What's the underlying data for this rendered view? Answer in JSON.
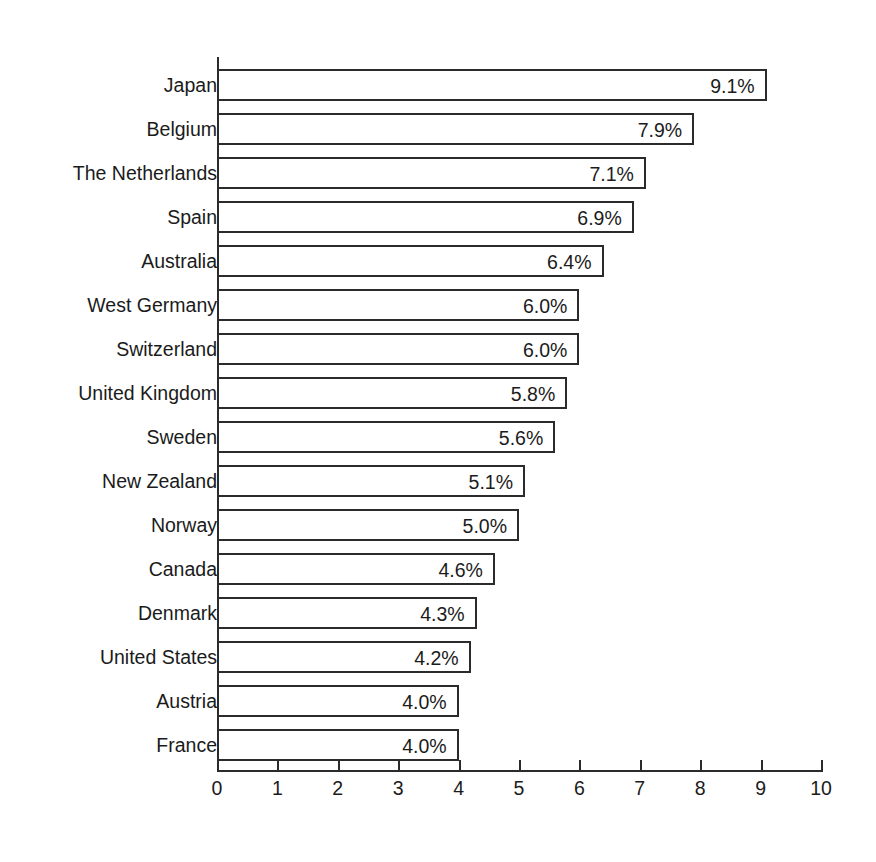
{
  "chart_data": {
    "type": "bar",
    "orientation": "horizontal",
    "title": "",
    "subtitle": "",
    "xlabel": "",
    "ylabel": "",
    "xlim": [
      0,
      10
    ],
    "grid": false,
    "legend": null,
    "value_suffix": "%",
    "xticks": [
      "0",
      "1",
      "2",
      "3",
      "4",
      "5",
      "6",
      "7",
      "8",
      "9",
      "10"
    ],
    "categories": [
      "Japan",
      "Belgium",
      "The Netherlands",
      "Spain",
      "Australia",
      "West Germany",
      "Switzerland",
      "United Kingdom",
      "Sweden",
      "New Zealand",
      "Norway",
      "Canada",
      "Denmark",
      "United States",
      "Austria",
      "France"
    ],
    "values": [
      9.1,
      7.9,
      7.1,
      6.9,
      6.4,
      6.0,
      6.0,
      5.8,
      5.6,
      5.1,
      5.0,
      4.6,
      4.3,
      4.2,
      4.0,
      4.0
    ],
    "data_labels": [
      "9.1%",
      "7.9%",
      "7.1%",
      "6.9%",
      "6.4%",
      "6.0%",
      "6.0%",
      "5.8%",
      "5.6%",
      "5.1%",
      "5.0%",
      "4.6%",
      "4.3%",
      "4.2%",
      "4.0%",
      "4.0%"
    ],
    "colors": {
      "bar_fill": "#ffffff",
      "bar_stroke": "#2b2b2b",
      "text": "#1b1b1b",
      "frame": "#3a3a3a",
      "background": "#ffffff"
    }
  }
}
